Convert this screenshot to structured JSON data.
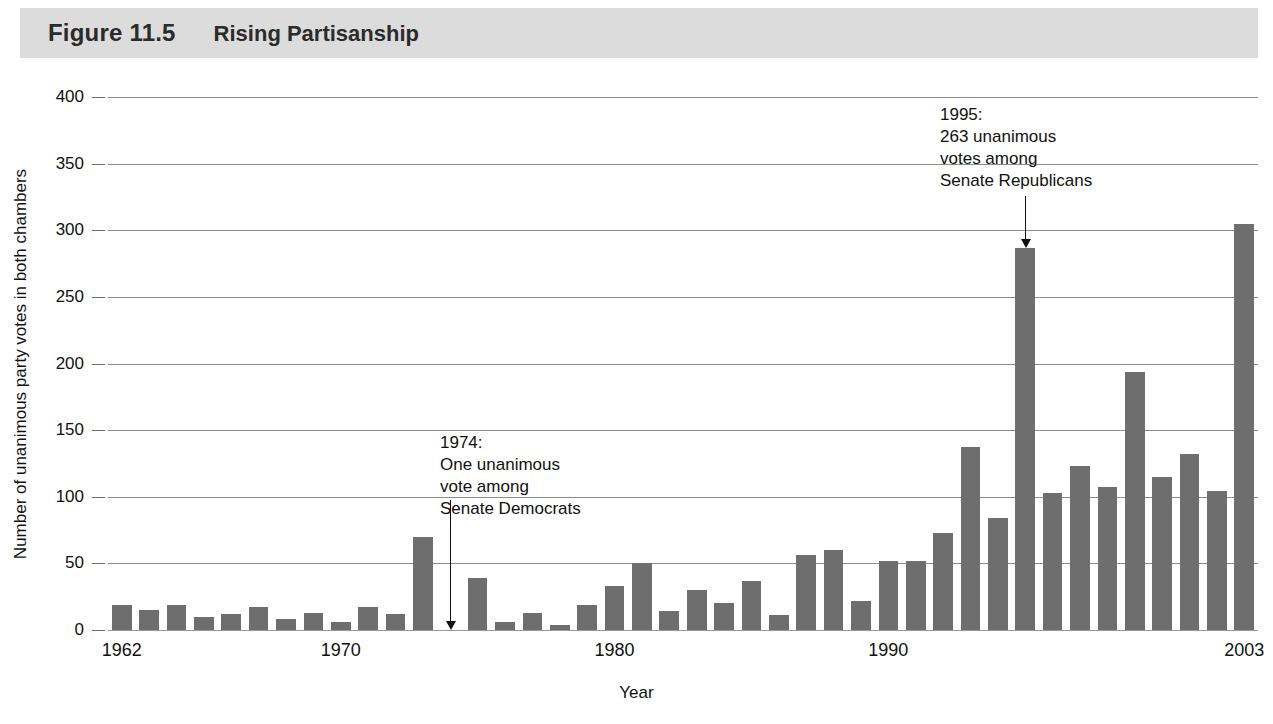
{
  "header": {
    "figure_number": "Figure 11.5",
    "title": "Rising Partisanship"
  },
  "chart_data": {
    "type": "bar",
    "title": "Rising Partisanship",
    "xlabel": "Year",
    "ylabel": "Number of unanimous party votes in both chambers",
    "ylim": [
      0,
      400
    ],
    "ytick_labels": [
      "0",
      "50",
      "100",
      "150",
      "200",
      "250",
      "300",
      "350",
      "400"
    ],
    "yticks": [
      0,
      50,
      100,
      150,
      200,
      250,
      300,
      350,
      400
    ],
    "grid": true,
    "legend": "none",
    "xtick_labels": [
      "1962",
      "1970",
      "1980",
      "1990",
      "2003"
    ],
    "xticks": [
      1962,
      1970,
      1980,
      1990,
      2003
    ],
    "bar_color": "#6e6e6e",
    "categories": [
      "1962",
      "1963",
      "1964",
      "1965",
      "1966",
      "1967",
      "1968",
      "1969",
      "1970",
      "1971",
      "1972",
      "1973",
      "1974",
      "1975",
      "1976",
      "1977",
      "1978",
      "1979",
      "1980",
      "1981",
      "1982",
      "1983",
      "1984",
      "1985",
      "1986",
      "1987",
      "1988",
      "1989",
      "1990",
      "1991",
      "1992",
      "1993",
      "1994",
      "1995",
      "1996",
      "1997",
      "1998",
      "1999",
      "2000",
      "2001",
      "2002",
      "2003"
    ],
    "values": [
      19,
      15,
      19,
      10,
      12,
      17,
      8,
      13,
      6,
      17,
      12,
      70,
      0,
      39,
      6,
      13,
      4,
      19,
      33,
      50,
      14,
      30,
      20,
      37,
      11,
      56,
      60,
      22,
      52,
      52,
      73,
      137,
      84,
      287,
      103,
      123,
      107,
      194,
      115,
      132,
      104,
      305
    ],
    "annotations": [
      {
        "id": "annotation-1974",
        "lines": [
          "1974:",
          "One unanimous",
          "vote among",
          "Senate Democrats"
        ],
        "target_year": "1974",
        "target_value": 0
      },
      {
        "id": "annotation-1995",
        "lines": [
          "1995:",
          "263 unanimous",
          "votes among",
          "Senate Republicans"
        ],
        "target_year": "1995",
        "target_value": 287
      }
    ]
  }
}
